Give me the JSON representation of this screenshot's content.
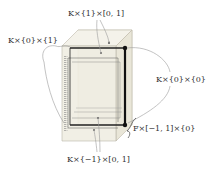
{
  "diagram": {
    "type": "product-box-3d",
    "labels": {
      "top": "K×{1}×[0, 1]",
      "left": "K×{0}×{1}",
      "right": "K×{0}×{0}",
      "bottom_right": "F×[−1, 1]×{0}",
      "bottom": "K×{−1}×[0, 1]"
    },
    "colors": {
      "box_fill": "#efece0",
      "box_edge": "#b9b6a8",
      "frame": "#222222",
      "leader": "#9a9a9a",
      "text": "#333333"
    }
  }
}
